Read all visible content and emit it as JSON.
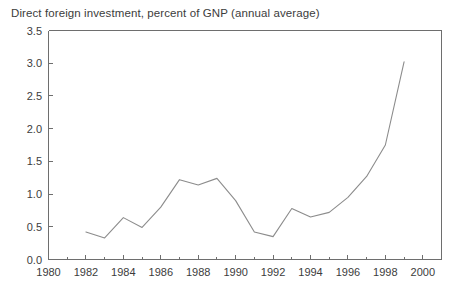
{
  "chart_data": {
    "type": "line",
    "title": "Direct foreign investment, percent of GNP (annual average)",
    "xlabel": "",
    "ylabel": "",
    "xlim": [
      1980,
      2001
    ],
    "ylim": [
      0.0,
      3.5
    ],
    "grid": false,
    "legend": false,
    "x": [
      1982,
      1983,
      1984,
      1985,
      1986,
      1987,
      1988,
      1989,
      1990,
      1991,
      1992,
      1993,
      1994,
      1995,
      1996,
      1997,
      1998,
      1999
    ],
    "values": [
      0.42,
      0.33,
      0.64,
      0.49,
      0.8,
      1.22,
      1.14,
      1.24,
      0.9,
      0.42,
      0.35,
      0.78,
      0.65,
      0.72,
      0.95,
      1.27,
      1.75,
      3.02
    ],
    "series": [
      {
        "name": "Direct foreign investment",
        "color": "#8c8c8c",
        "values": [
          0.42,
          0.33,
          0.64,
          0.49,
          0.8,
          1.22,
          1.14,
          1.24,
          0.9,
          0.42,
          0.35,
          0.78,
          0.65,
          0.72,
          0.95,
          1.27,
          1.75,
          3.02
        ]
      }
    ],
    "y_ticks": [
      "0.0",
      "0.5",
      "1.0",
      "1.5",
      "2.0",
      "2.5",
      "3.0",
      "3.5"
    ],
    "y_tick_values": [
      0.0,
      0.5,
      1.0,
      1.5,
      2.0,
      2.5,
      3.0,
      3.5
    ],
    "x_ticks": [
      "1980",
      "1982",
      "1984",
      "1986",
      "1988",
      "1990",
      "1992",
      "1994",
      "1996",
      "1998",
      "2000"
    ],
    "x_tick_values": [
      1980,
      1982,
      1984,
      1986,
      1988,
      1990,
      1992,
      1994,
      1996,
      1998,
      2000
    ],
    "x_minor_values": [
      1981,
      1983,
      1985,
      1987,
      1989,
      1991,
      1993,
      1995,
      1997,
      1999,
      2001
    ],
    "axis_color": "#6e6e6e",
    "text_color": "#3c3c3c",
    "background": "#ffffff"
  }
}
